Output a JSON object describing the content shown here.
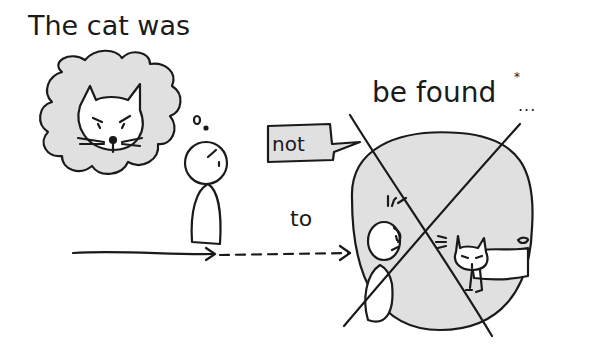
{
  "caption": {
    "line1": "The cat was",
    "line2": "be found",
    "asterisk": "*",
    "ellipsis": "...",
    "to": "to",
    "not": "not"
  },
  "colors": {
    "ink": "#1a1a1a",
    "fill": "#e0e0e0",
    "background": "#ffffff"
  },
  "scene": {
    "thought_bubble": "cat-face",
    "person": "stick-figure",
    "circle": "crossed-out-scene",
    "arrow": "solid-then-dashed"
  }
}
